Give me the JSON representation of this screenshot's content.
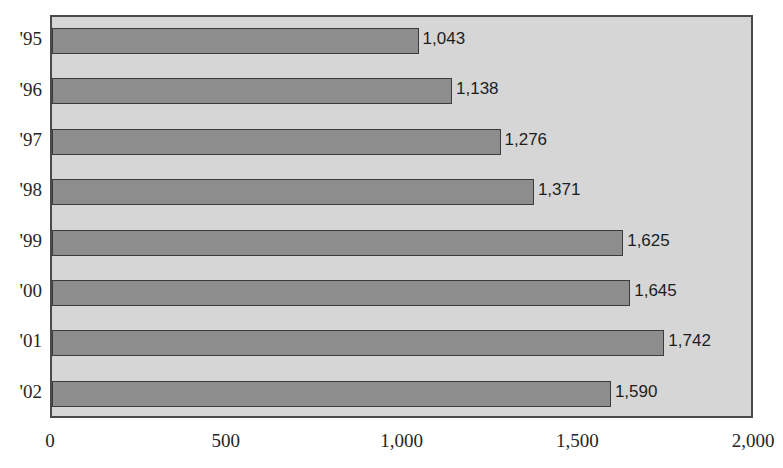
{
  "chart_data": {
    "type": "bar",
    "orientation": "horizontal",
    "title": "",
    "xlabel": "",
    "ylabel": "",
    "categories": [
      "'95",
      "'96",
      "'97",
      "'98",
      "'99",
      "'00",
      "'01",
      "'02"
    ],
    "values": [
      1043,
      1138,
      1276,
      1371,
      1625,
      1645,
      1742,
      1590
    ],
    "value_labels": [
      "1,043",
      "1,138",
      "1,276",
      "1,371",
      "1,625",
      "1,645",
      "1,742",
      "1,590"
    ],
    "xlim": [
      0,
      2000
    ],
    "xticks": [
      0,
      500,
      1000,
      1500,
      2000
    ],
    "xtick_labels": [
      "0",
      "500",
      "1,000",
      "1,500",
      "2,000"
    ],
    "grid": false,
    "legend": null,
    "series": [
      {
        "name": "",
        "values": [
          1043,
          1138,
          1276,
          1371,
          1625,
          1645,
          1742,
          1590
        ]
      }
    ],
    "colors": {
      "bar_fill": "#8d8d8d",
      "bar_border": "#3b3b3b",
      "plot_background": "#d6d6d6",
      "plot_border": "#4a4a4a",
      "page_background": "#ffffff",
      "text": "#262626"
    }
  }
}
